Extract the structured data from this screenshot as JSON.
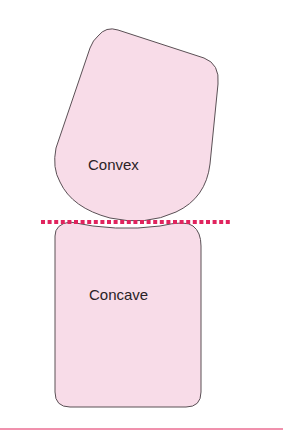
{
  "diagram": {
    "shapes": [
      {
        "id": "convex",
        "label": "Convex"
      },
      {
        "id": "concave",
        "label": "Concave"
      }
    ],
    "colors": {
      "fill": "#f8dce8",
      "stroke": "#5a5055",
      "dotted_line": "#e0245e",
      "bottom_line": "#ec6c92"
    }
  }
}
